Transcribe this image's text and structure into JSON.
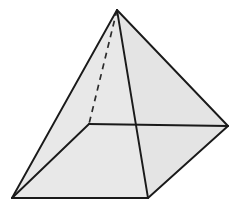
{
  "figure": {
    "name": "square-pyramid",
    "background_color": "#ffffff",
    "canvas": {
      "width": 244,
      "height": 210
    }
  },
  "style": {
    "edge_color": "#1a1a1a",
    "edge_width": 1.9,
    "hidden_edge_color": "#2b2b2b",
    "hidden_edge_width": 1.7,
    "hidden_edge_dash": "6 5",
    "face_light": "#efefef",
    "face_mid": "#e8e8e8",
    "face_base": "#ededed",
    "face_right": "#e4e4e4"
  },
  "vertices": {
    "apex": {
      "label": "apex",
      "x": 117,
      "y": 10
    },
    "back": {
      "label": "back-hidden-corner",
      "x": 89,
      "y": 124
    },
    "left": {
      "label": "left-corner",
      "x": 12,
      "y": 198
    },
    "front": {
      "label": "front-corner",
      "x": 148,
      "y": 198
    },
    "right": {
      "label": "right-corner",
      "x": 228,
      "y": 126
    }
  },
  "faces": [
    {
      "name": "face-left",
      "points": "117,10 89,124 12,198",
      "fill": "#efefef",
      "visible": true
    },
    {
      "name": "face-front-left",
      "points": "117,10 12,198 148,198",
      "fill": "#e8e8e8",
      "visible": true
    },
    {
      "name": "face-front-right",
      "points": "117,10 148,198 228,126",
      "fill": "#e4e4e4",
      "visible": true
    },
    {
      "name": "face-base",
      "points": "89,124 12,198 148,198 228,126",
      "fill": "#ededed",
      "visible": true
    }
  ],
  "edges": [
    {
      "name": "edge-apex-left",
      "from": "apex",
      "to": "left",
      "hidden": false
    },
    {
      "name": "edge-apex-front",
      "from": "apex",
      "to": "front",
      "hidden": false
    },
    {
      "name": "edge-apex-right",
      "from": "apex",
      "to": "right",
      "hidden": false
    },
    {
      "name": "edge-apex-back",
      "from": "apex",
      "to": "back",
      "hidden": true
    },
    {
      "name": "edge-base-back-left",
      "from": "back",
      "to": "left",
      "hidden": false
    },
    {
      "name": "edge-base-back-right",
      "from": "back",
      "to": "right",
      "hidden": false
    },
    {
      "name": "edge-base-left-front",
      "from": "left",
      "to": "front",
      "hidden": false
    },
    {
      "name": "edge-base-front-right",
      "from": "front",
      "to": "right",
      "hidden": false
    }
  ]
}
